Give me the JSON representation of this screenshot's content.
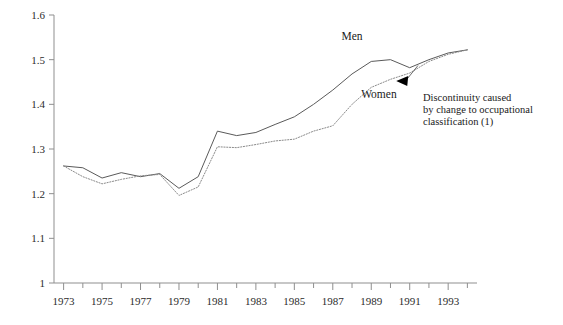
{
  "chart_data": {
    "type": "line",
    "title": "",
    "subtitle": "",
    "xlabel": "",
    "ylabel": "",
    "xlim": [
      1972.5,
      1994.5
    ],
    "ylim": [
      1.0,
      1.6
    ],
    "grid": false,
    "legend_position": "inline-labels",
    "y_ticks": [
      "1",
      "1.1",
      "1.2",
      "1.3",
      "1.4",
      "1.5",
      "1.6"
    ],
    "y_tick_values": [
      1.0,
      1.1,
      1.2,
      1.3,
      1.4,
      1.5,
      1.6
    ],
    "x_ticks": [
      "1973",
      "1975",
      "1977",
      "1979",
      "1981",
      "1983",
      "1985",
      "1987",
      "1989",
      "1991",
      "1993"
    ],
    "x_tick_values": [
      1973,
      1975,
      1977,
      1979,
      1981,
      1983,
      1985,
      1987,
      1989,
      1991,
      1993
    ],
    "x_minor_ticks": [
      1974,
      1976,
      1978,
      1980,
      1982,
      1984,
      1986,
      1988,
      1990,
      1992,
      1994
    ],
    "x": [
      1973,
      1974,
      1975,
      1976,
      1977,
      1978,
      1979,
      1980,
      1981,
      1982,
      1983,
      1984,
      1985,
      1986,
      1987,
      1988,
      1989,
      1990,
      1991,
      1992,
      1993,
      1994
    ],
    "series": [
      {
        "name": "Men",
        "style": "solid",
        "color": "#5a5a5a",
        "values": [
          1.262,
          1.258,
          1.235,
          1.247,
          1.238,
          1.245,
          1.212,
          1.238,
          1.34,
          1.33,
          1.337,
          1.355,
          1.372,
          1.4,
          1.432,
          1.468,
          1.496,
          1.5,
          1.482,
          1.5,
          1.515,
          1.522
        ]
      },
      {
        "name": "Women",
        "style": "dotted",
        "color": "#8a8a8a",
        "values": [
          1.262,
          1.238,
          1.222,
          1.232,
          1.24,
          1.243,
          1.196,
          1.215,
          1.305,
          1.303,
          1.31,
          1.318,
          1.322,
          1.34,
          1.352,
          1.4,
          1.438,
          1.456,
          1.47,
          1.496,
          1.512,
          1.522
        ]
      }
    ],
    "annotations": [
      {
        "id": "discontinuity-note",
        "lines": [
          "Discontinuity caused",
          "by change to occupational",
          "classification (1)"
        ],
        "arrow_points_to_x": 1990.3,
        "arrow_points_to_y": 1.452
      }
    ],
    "series_labels": [
      {
        "name": "Men",
        "at_x": 1988.0,
        "at_y": 1.545
      },
      {
        "name": "Women",
        "at_x": 1989.4,
        "at_y": 1.415
      }
    ],
    "colors": {
      "axis": "#8f8f8f",
      "men_line": "#5a5a5a",
      "women_line": "#8a8a8a",
      "text": "#1a1a1a",
      "background": "#ffffff"
    }
  }
}
